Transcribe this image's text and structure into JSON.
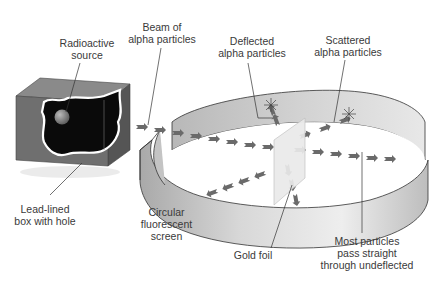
{
  "diagram": {
    "colors": {
      "box_face": "#6f6f6f",
      "box_top": "#8a8a8a",
      "box_side": "#555555",
      "box_interior": "#0a0a0a",
      "screen_outer": "#c9c9c9",
      "screen_inner": "#e4e4e4",
      "particle": "#6a6a6a",
      "foil": "#e6e6e6",
      "leader_line": "#333333",
      "text": "#3a3a3a"
    },
    "labels": {
      "radioactive_source": [
        "Radioactive",
        "source"
      ],
      "beam": [
        "Beam of",
        "alpha particles"
      ],
      "deflected": [
        "Deflected",
        "alpha particles"
      ],
      "scattered": [
        "Scattered",
        "alpha particles"
      ],
      "lead_box": [
        "Lead-lined",
        "box with hole"
      ],
      "screen": [
        "Circular",
        "fluorescent",
        "screen"
      ],
      "gold_foil": [
        "Gold foil"
      ],
      "undeflected": [
        "Most particles",
        "pass straight",
        "through undeflected"
      ]
    }
  }
}
